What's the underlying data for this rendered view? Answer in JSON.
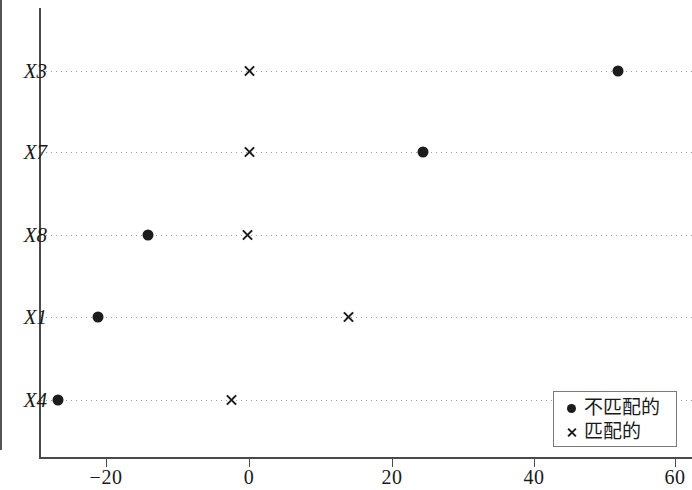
{
  "chart_data": {
    "type": "scatter",
    "title": "",
    "xlabel": "",
    "ylabel": "",
    "xlim": [
      -30,
      62
    ],
    "ylim_categories": [
      "X3",
      "X7",
      "X8",
      "X1",
      "X4"
    ],
    "categories": [
      "X3",
      "X7",
      "X8",
      "X1",
      "X4"
    ],
    "xticks": [
      -20,
      0,
      20,
      40,
      60
    ],
    "xtick_labels": [
      "−20",
      "0",
      "20",
      "40",
      "60"
    ],
    "grid": true,
    "grid_style": "dotted-horizontal",
    "zero_reference_line": 0,
    "legend_position": "bottom-right",
    "series": [
      {
        "name": "不匹配的",
        "marker": "filled-circle",
        "color": "#1c1c1c",
        "values": [
          52.0,
          24.5,
          -14.2,
          -21.3,
          -26.9
        ]
      },
      {
        "name": "匹配的",
        "marker": "cross",
        "color": "#1c1c1c",
        "values": [
          0.0,
          0.0,
          -0.2,
          14.0,
          -2.5
        ]
      }
    ],
    "points": [
      {
        "category": "X3",
        "series": "不匹配的",
        "x": 52.0
      },
      {
        "category": "X3",
        "series": "匹配的",
        "x": 0.0
      },
      {
        "category": "X7",
        "series": "不匹配的",
        "x": 24.5
      },
      {
        "category": "X7",
        "series": "匹配的",
        "x": 0.0
      },
      {
        "category": "X8",
        "series": "不匹配的",
        "x": -14.2
      },
      {
        "category": "X8",
        "series": "匹配的",
        "x": -0.2
      },
      {
        "category": "X1",
        "series": "不匹配的",
        "x": -21.3
      },
      {
        "category": "X1",
        "series": "匹配的",
        "x": 14.0
      },
      {
        "category": "X4",
        "series": "不匹配的",
        "x": -26.9
      },
      {
        "category": "X4",
        "series": "匹配的",
        "x": -2.5
      }
    ]
  },
  "axis": {
    "y_labels": [
      "X3",
      "X7",
      "X8",
      "X1",
      "X4"
    ],
    "x_tick_labels": [
      "−20",
      "0",
      "20",
      "40",
      "60"
    ]
  },
  "legend": {
    "entries": [
      {
        "label": "不匹配的",
        "glyph": "dot-marker-icon"
      },
      {
        "label": "匹配的",
        "glyph": "cross-marker-icon"
      }
    ]
  }
}
